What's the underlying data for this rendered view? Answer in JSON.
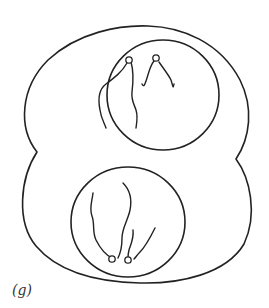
{
  "figure": {
    "panel_label": "(g)",
    "stroke_color": "#222222",
    "background": "#ffffff",
    "parts": [
      {
        "name": "outer-cell-outline",
        "shape": "two-lobed outline pinched at mid-height"
      },
      {
        "name": "upper-nucleus",
        "shape": "circle",
        "filaments": 2
      },
      {
        "name": "lower-nucleus",
        "shape": "circle",
        "filaments": 2
      }
    ]
  }
}
